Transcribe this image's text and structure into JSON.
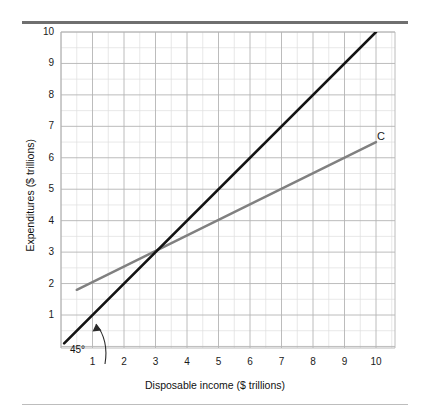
{
  "figure": {
    "background_color": "#ffffff",
    "rule_color": "#6f6f6f",
    "rule_bottom_color": "#bdbdbd"
  },
  "chart_data": {
    "type": "line",
    "title": "",
    "xlabel": "Disposable income ($ trillions)",
    "ylabel": "Expenditures ($ trillions)",
    "xlim": [
      0,
      10.6
    ],
    "ylim": [
      0,
      10.1
    ],
    "xticks": [
      "1",
      "2",
      "3",
      "4",
      "5",
      "6",
      "7",
      "8",
      "9",
      "10"
    ],
    "xtick_values": [
      1,
      2,
      3,
      4,
      5,
      6,
      7,
      8,
      9,
      10
    ],
    "yticks": [
      "1",
      "2",
      "3",
      "4",
      "5",
      "6",
      "7",
      "8",
      "9",
      "10"
    ],
    "ytick_values": [
      1,
      2,
      3,
      4,
      5,
      6,
      7,
      8,
      9,
      10
    ],
    "grid": "major and minor (half-unit) gridlines on both axes",
    "grid_color_major": "#b6b6b6",
    "grid_color_minor": "#dcdcdc",
    "legend": "none (inline curve labels)",
    "series": [
      {
        "name": "45-degree line",
        "label": "45°",
        "color": "#141414",
        "width": 2.6,
        "x": [
          0.1,
          10.0
        ],
        "y": [
          0.1,
          10.0
        ],
        "slope": 1,
        "intercept": 0
      },
      {
        "name": "C",
        "label": "C",
        "color": "#808080",
        "width": 2.4,
        "x": [
          0.5,
          10.0
        ],
        "y": [
          1.8,
          6.5
        ],
        "slope": 0.4947,
        "intercept": 1.553
      }
    ],
    "annotations": [
      {
        "name": "angle-annotation",
        "text": "45°",
        "x": 1.15,
        "y": 0.45,
        "arrow_to_x": 1.05,
        "arrow_to_y": 1.0
      },
      {
        "name": "curve-c-label",
        "text": "C",
        "x": 10.05,
        "y": 6.9
      }
    ],
    "intersection": {
      "x": 3,
      "y": 3
    }
  }
}
